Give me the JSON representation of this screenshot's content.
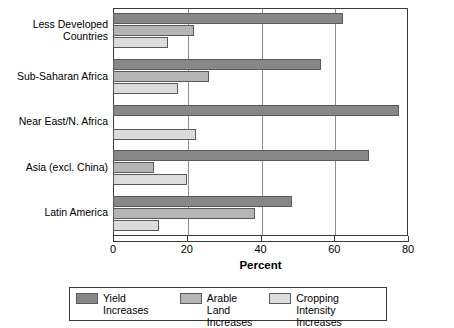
{
  "chart_data": {
    "type": "bar",
    "orientation": "horizontal",
    "title": "",
    "xlabel": "Percent",
    "ylabel": "",
    "xlim": [
      0,
      80
    ],
    "xticks": [
      0,
      20,
      40,
      60,
      80
    ],
    "grid": true,
    "legend_position": "bottom",
    "categories": [
      "Less Developed\nCountries",
      "Sub-Saharan Africa",
      "Near East/N. Africa",
      "Asia (excl. China)",
      "Latin America"
    ],
    "series": [
      {
        "name": "Yield Increases",
        "color": "#878787",
        "values": [
          62.5,
          56.5,
          77.5,
          69.5,
          48.5
        ]
      },
      {
        "name": "Arable Land\nIncreases",
        "color": "#b5b5b5",
        "values": [
          22.0,
          26.0,
          0.0,
          11.0,
          38.5
        ]
      },
      {
        "name": "Cropping Intensity\nIncreases",
        "color": "#dcdcdc",
        "values": [
          15.0,
          17.5,
          22.5,
          20.0,
          12.5
        ]
      }
    ]
  },
  "axis": {
    "x_title": "Percent",
    "tick_labels": [
      "0",
      "20",
      "40",
      "60",
      "80"
    ]
  },
  "legend": {
    "entries": [
      {
        "label": "Yield Increases",
        "swatch": "dark-gray-swatch"
      },
      {
        "label": "Arable Land\nIncreases",
        "swatch": "medium-gray-swatch"
      },
      {
        "label": "Cropping Intensity\nIncreases",
        "swatch": "light-gray-swatch"
      }
    ]
  }
}
